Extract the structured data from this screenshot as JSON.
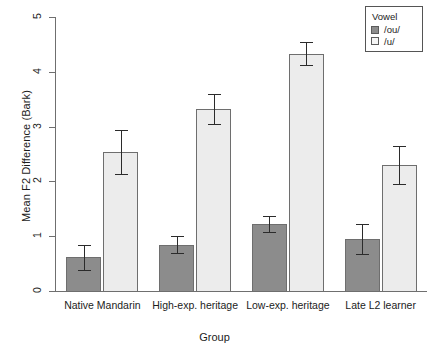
{
  "chart_data": {
    "type": "bar",
    "title": "",
    "xlabel": "Group",
    "ylabel": "Mean F2 Difference (Bark)",
    "ylim": [
      0,
      5
    ],
    "yticks": [
      0,
      1,
      2,
      3,
      4,
      5
    ],
    "grid": false,
    "categories": [
      "Native Mandarin",
      "High-exp. heritage",
      "Low-exp. heritage",
      "Late L2 learner"
    ],
    "series": [
      {
        "name": "/ou/",
        "color": "#8c8c8c",
        "values": [
          0.62,
          0.84,
          1.22,
          0.95
        ],
        "err_low": [
          0.38,
          0.7,
          1.08,
          0.67
        ],
        "err_high": [
          0.84,
          1.0,
          1.37,
          1.23
        ]
      },
      {
        "name": "/u/",
        "color": "#ececec",
        "values": [
          2.54,
          3.32,
          4.33,
          2.3
        ],
        "err_low": [
          2.13,
          3.04,
          4.12,
          1.96
        ],
        "err_high": [
          2.94,
          3.6,
          4.55,
          2.64
        ]
      }
    ],
    "legend": {
      "title": "Vowel",
      "position": "top-right",
      "entries": [
        {
          "label": "/ou/",
          "swatch": "dark"
        },
        {
          "label": "/u/",
          "swatch": "light"
        }
      ]
    }
  },
  "axis": {
    "y_tick_labels": [
      "0",
      "1",
      "2",
      "3",
      "4",
      "5"
    ],
    "y_title": "Mean F2 Difference (Bark)",
    "x_title": "Group"
  },
  "legend": {
    "title": "Vowel",
    "item_0_label": "/ou/",
    "item_1_label": "/u/"
  }
}
